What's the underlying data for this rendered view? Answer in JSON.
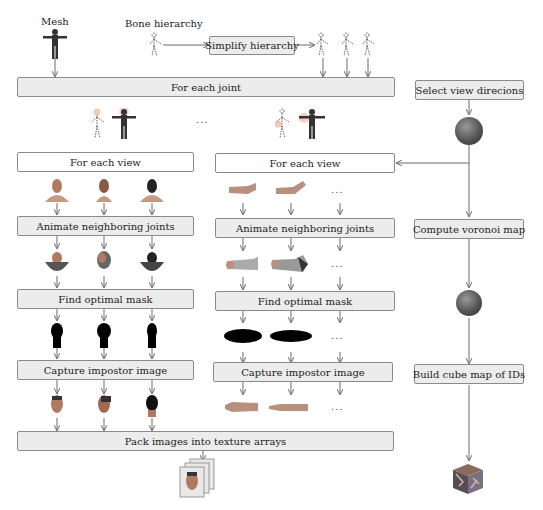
{
  "labels": {
    "mesh": "Mesh",
    "bone_hierarchy": "Bone hierarchy"
  },
  "boxes": {
    "simplify_hierarchy": "Simplify hierarchy",
    "for_each_joint": "For each joint",
    "select_view_directions": "Select view direcions",
    "left_column": {
      "for_each_view": "For each view",
      "animate_neighboring_joints": "Animate neighboring joints",
      "find_optimal_mask": "Find optimal mask",
      "capture_impostor_image": "Capture impostor image"
    },
    "right_column": {
      "for_each_view": "For each view",
      "animate_neighboring_joints": "Animate neighboring joints",
      "find_optimal_mask": "Find optimal mask",
      "capture_impostor_image": "Capture impostor image"
    },
    "compute_voronoi_map": "Compute voronoi map",
    "build_cube_map_of_ids": "Build cube map of IDs",
    "pack_images": "Pack images into texture arrays"
  },
  "ellipsis": "...",
  "colors": {
    "box_fill": "#ececec",
    "box_border": "#8a8a8a",
    "arrow": "#6a6a6a"
  }
}
